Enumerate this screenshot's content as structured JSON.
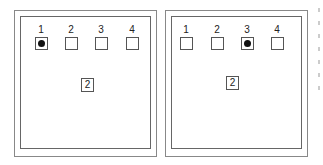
{
  "panels": [
    {
      "positions": [
        {
          "label": "1",
          "selected": true
        },
        {
          "label": "2",
          "selected": false
        },
        {
          "label": "3",
          "selected": false
        },
        {
          "label": "4",
          "selected": false
        }
      ],
      "center_value": "2"
    },
    {
      "positions": [
        {
          "label": "1",
          "selected": false
        },
        {
          "label": "2",
          "selected": false
        },
        {
          "label": "3",
          "selected": true
        },
        {
          "label": "4",
          "selected": false
        }
      ],
      "center_value": "2"
    }
  ]
}
